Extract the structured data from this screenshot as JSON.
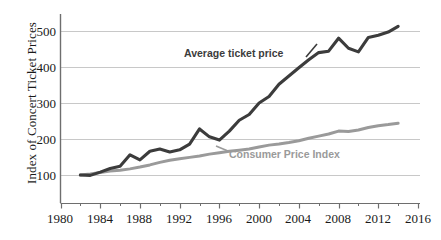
{
  "chart_data": {
    "type": "line",
    "title": "",
    "xlabel": "",
    "ylabel": "Index of Concert Ticket Prices",
    "xlim": [
      1980,
      2016
    ],
    "ylim": [
      0,
      540
    ],
    "xticks": [
      1980,
      1984,
      1988,
      1992,
      1996,
      2000,
      2004,
      2008,
      2012,
      2016
    ],
    "yticks": [
      100,
      200,
      300,
      400,
      500
    ],
    "grid": "horizontal",
    "legend_position": "inline-annotation",
    "x": [
      1982,
      1983,
      1984,
      1985,
      1986,
      1987,
      1988,
      1989,
      1990,
      1991,
      1992,
      1993,
      1994,
      1995,
      1996,
      1997,
      1998,
      1999,
      2000,
      2001,
      2002,
      2003,
      2004,
      2005,
      2006,
      2007,
      2008,
      2009,
      2010,
      2011,
      2012,
      2013,
      2014
    ],
    "series": [
      {
        "name": "Average ticket price",
        "color": "#3c3c3c",
        "values": [
          100,
          99,
          108,
          118,
          124,
          156,
          142,
          166,
          172,
          164,
          170,
          186,
          228,
          206,
          197,
          222,
          252,
          268,
          300,
          318,
          352,
          375,
          398,
          420,
          440,
          444,
          480,
          452,
          442,
          482,
          488,
          497,
          513
        ]
      },
      {
        "name": "Consumer Price Index",
        "color": "#9a9a9a",
        "values": [
          100,
          103,
          107,
          111,
          113,
          117,
          122,
          128,
          135,
          141,
          145,
          149,
          153,
          158,
          162,
          166,
          169,
          172,
          178,
          183,
          186,
          190,
          195,
          202,
          208,
          214,
          222,
          221,
          225,
          232,
          237,
          240,
          244
        ]
      }
    ]
  },
  "annotations": [
    {
      "id": "avg",
      "text": "Average ticket price"
    },
    {
      "id": "cpi",
      "text": "Consumer Price Index"
    }
  ],
  "axis": {
    "y_title": "Index of Concert Ticket Prices",
    "y_tick_labels": [
      "500",
      "400",
      "300",
      "200",
      "100"
    ],
    "x_tick_labels": [
      "1980",
      "1984",
      "1988",
      "1992",
      "1996",
      "2000",
      "2004",
      "2008",
      "2012",
      "2016"
    ]
  },
  "colors": {
    "average_ticket_price_line": "#3c3c3c",
    "consumer_price_index_line": "#9a9a9a",
    "gridline": "#c8c8c8",
    "axis": "#6e6e6e",
    "text": "#1a1a1a"
  }
}
